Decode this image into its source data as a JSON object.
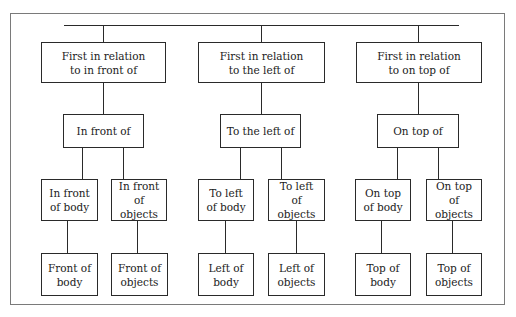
{
  "diagram": {
    "type": "tree",
    "root_connector": "horizontal top bar",
    "groups": [
      {
        "id": "in-front-of",
        "top": "First in relation\nto in front of",
        "middle": "In front of",
        "children": [
          {
            "label": "In front\nof body",
            "leaf": "Front of\nbody"
          },
          {
            "label": "In front\nof objects",
            "leaf": "Front of\nobjects"
          }
        ]
      },
      {
        "id": "left-of",
        "top": "First in relation\nto the left of",
        "middle": "To the left of",
        "children": [
          {
            "label": "To left\nof body",
            "leaf": "Left of\nbody"
          },
          {
            "label": "To left\nof objects",
            "leaf": "Left of\nobjects"
          }
        ]
      },
      {
        "id": "on-top-of",
        "top": "First in relation\nto on top of",
        "middle": "On top of",
        "children": [
          {
            "label": "On top\nof body",
            "leaf": "Top of\nbody"
          },
          {
            "label": "On top\nof objects",
            "leaf": "Top of\nobjects"
          }
        ]
      }
    ]
  },
  "colors": {
    "line": "#2a2a2a",
    "frame": "#7a7a7a",
    "background": "#ffffff"
  }
}
